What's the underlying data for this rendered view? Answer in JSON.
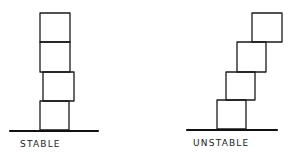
{
  "diagram": {
    "stable": {
      "label": "STABLE",
      "blocks": [
        {
          "x": 40,
          "y": 13,
          "w": 30,
          "h": 29
        },
        {
          "x": 40,
          "y": 42,
          "w": 30,
          "h": 30
        },
        {
          "x": 43,
          "y": 72,
          "w": 31,
          "h": 29
        },
        {
          "x": 40,
          "y": 101,
          "w": 29,
          "h": 29
        }
      ],
      "ground": {
        "x1": 10,
        "x2": 98,
        "y": 131
      }
    },
    "unstable": {
      "label": "UNSTABLE",
      "blocks": [
        {
          "x": 252,
          "y": 13,
          "w": 30,
          "h": 29
        },
        {
          "x": 237,
          "y": 42,
          "w": 29,
          "h": 30
        },
        {
          "x": 226,
          "y": 72,
          "w": 29,
          "h": 28
        },
        {
          "x": 217,
          "y": 100,
          "w": 29,
          "h": 29
        }
      ],
      "ground": {
        "x1": 187,
        "x2": 277,
        "y": 130
      }
    },
    "colors": {
      "ink": "#1a1a1a",
      "background": "#ffffff"
    }
  }
}
